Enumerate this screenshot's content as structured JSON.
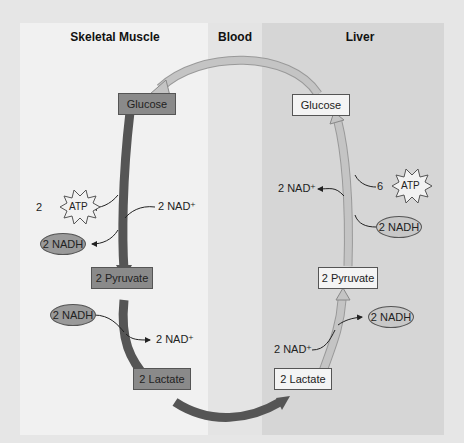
{
  "headers": {
    "muscle": "Skeletal Muscle",
    "blood": "Blood",
    "liver": "Liver"
  },
  "muscle": {
    "glucose": "Glucose",
    "pyruvate": "2 Pyruvate",
    "lactate": "2 Lactate",
    "atp_coef": "2",
    "atp": "ATP",
    "nadh1": "2 NADH",
    "nad1": "2 NAD⁺",
    "nadh2": "2 NADH",
    "nad2": "2 NAD⁺"
  },
  "liver": {
    "glucose": "Glucose",
    "pyruvate": "2 Pyruvate",
    "lactate": "2 Lactate",
    "atp_coef": "6",
    "atp": "ATP",
    "nad1": "2 NAD⁺",
    "nadh1": "2 NADH",
    "nadh2": "2 NADH",
    "nad2": "2 NAD⁺"
  },
  "colors": {
    "dark_arrow": "#555555",
    "light_arrow": "#b8b8b8",
    "dark_box": "#8a8a8a",
    "light_box": "#f4f4f4"
  }
}
